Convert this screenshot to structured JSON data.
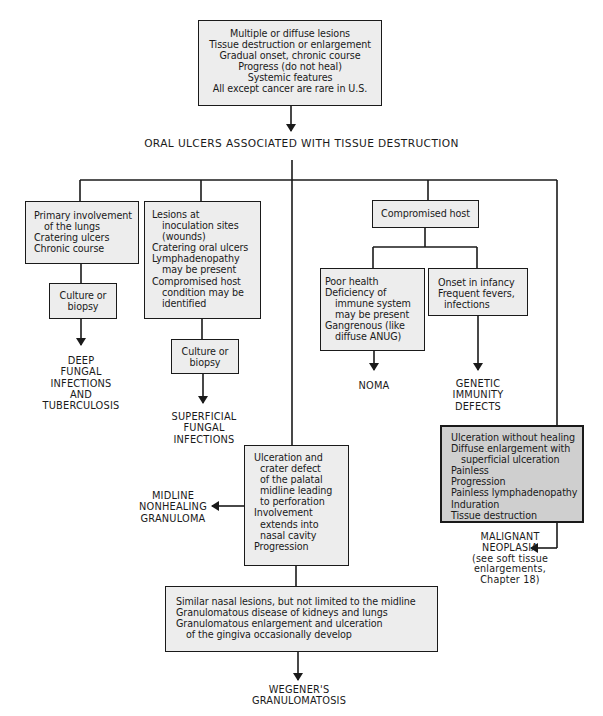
{
  "title": "ORAL ULCERS ASSOCIATED WITH TISSUE DESTRUCTION",
  "top_box": {
    "lines": [
      "Multiple or diffuse lesions",
      "Tissue destruction or enlargement",
      "Gradual onset, chronic course",
      "Progress (do not heal)",
      "Systemic features",
      "All except cancer are rare in U.S."
    ]
  },
  "branches": {
    "deep": {
      "criteria": [
        "Primary involvement",
        "of the lungs",
        "Cratering ulcers",
        "Chronic course"
      ],
      "test": [
        "Culture or",
        "biopsy"
      ],
      "diagnosis": [
        "DEEP",
        "FUNGAL",
        "INFECTIONS",
        "AND",
        "TUBERCULOSIS"
      ]
    },
    "superficial": {
      "criteria": [
        "Lesions at",
        "inoculation sites",
        "(wounds)",
        "Cratering oral ulcers",
        "Lymphadenopathy",
        "may be present",
        "Compromised host",
        "condition may be",
        "identified"
      ],
      "test": [
        "Culture or",
        "biopsy"
      ],
      "diagnosis": [
        "SUPERFICIAL",
        "FUNGAL",
        "INFECTIONS"
      ]
    },
    "compromised": {
      "label": "Compromised host",
      "noma": {
        "criteria": [
          "Poor health",
          "Deficiency of",
          "immune system",
          "may be present",
          "Gangrenous (like",
          "diffuse ANUG)"
        ],
        "diagnosis": [
          "NOMA"
        ]
      },
      "genetic": {
        "criteria": [
          "Onset in infancy",
          "Frequent fevers,",
          "infections"
        ],
        "diagnosis": [
          "GENETIC",
          "IMMUNITY",
          "DEFECTS"
        ]
      }
    },
    "midline": {
      "criteria": [
        "Ulceration and",
        "crater defect",
        "of the palatal",
        "midline leading",
        "to perforation",
        "Involvement",
        "extends into",
        "nasal cavity",
        "Progression"
      ],
      "diagnosis": [
        "MIDLINE",
        "NONHEALING",
        "GRANULOMA"
      ]
    },
    "wegener": {
      "criteria": [
        "Similar nasal lesions, but not limited to the midline",
        "Granulomatous disease of kidneys and lungs",
        "Granulomatous enlargement and ulceration",
        "of the gingiva occasionally develop"
      ],
      "diagnosis": [
        "WEGENER'S",
        "GRANULOMATOSIS"
      ]
    },
    "malignant": {
      "criteria": [
        "Ulceration without healing",
        "Diffuse enlargement with",
        "superficial ulceration",
        "Painless",
        "Progression",
        "Painless lymphadenopathy",
        "Induration",
        "Tissue destruction"
      ],
      "diagnosis": [
        "MALIGNANT",
        "NEOPLASIA",
        "(see soft tissue",
        "enlargements,",
        "Chapter 18)"
      ]
    }
  },
  "colors": {
    "line": "#1a1a1a",
    "box_fill": "#ededed",
    "box_fill_dark": "#cfcfcf"
  }
}
